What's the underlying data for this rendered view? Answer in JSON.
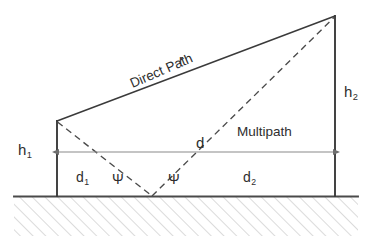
{
  "figure": {
    "background_color": "#ffffff",
    "line_color": "#3a3a3a",
    "dim_line_color": "#8a8a8a",
    "hatch_color": "#b9b9b9",
    "text_color": "#2e2e2e"
  },
  "labels": {
    "h1": "h",
    "h1_sub": "1",
    "h2": "h",
    "h2_sub": "2",
    "d": "d",
    "d1": "d",
    "d1_sub": "1",
    "d2": "d",
    "d2_sub": "2",
    "r": "r",
    "direct_path": "Direct Path",
    "multipath": "Multipath",
    "psi_left": "Ψ",
    "psi_right": "Ψ"
  },
  "geometry": {
    "ground_y": 196,
    "left_tower_x": 57,
    "left_tower_top_y": 122,
    "right_tower_x": 335,
    "right_tower_top_y": 16,
    "reflection_point_x": 152,
    "reflection_point_y": 196,
    "dimension_line_y": 152,
    "hatch_bottom_y": 236,
    "hatch_left_x": 14,
    "hatch_right_x": 358
  },
  "elements": {
    "direct_path_style": "solid",
    "multipath_style": "dashed",
    "tower_style": "solid",
    "ground_style": "solid",
    "dimension_arrow_style": "double-headed"
  }
}
